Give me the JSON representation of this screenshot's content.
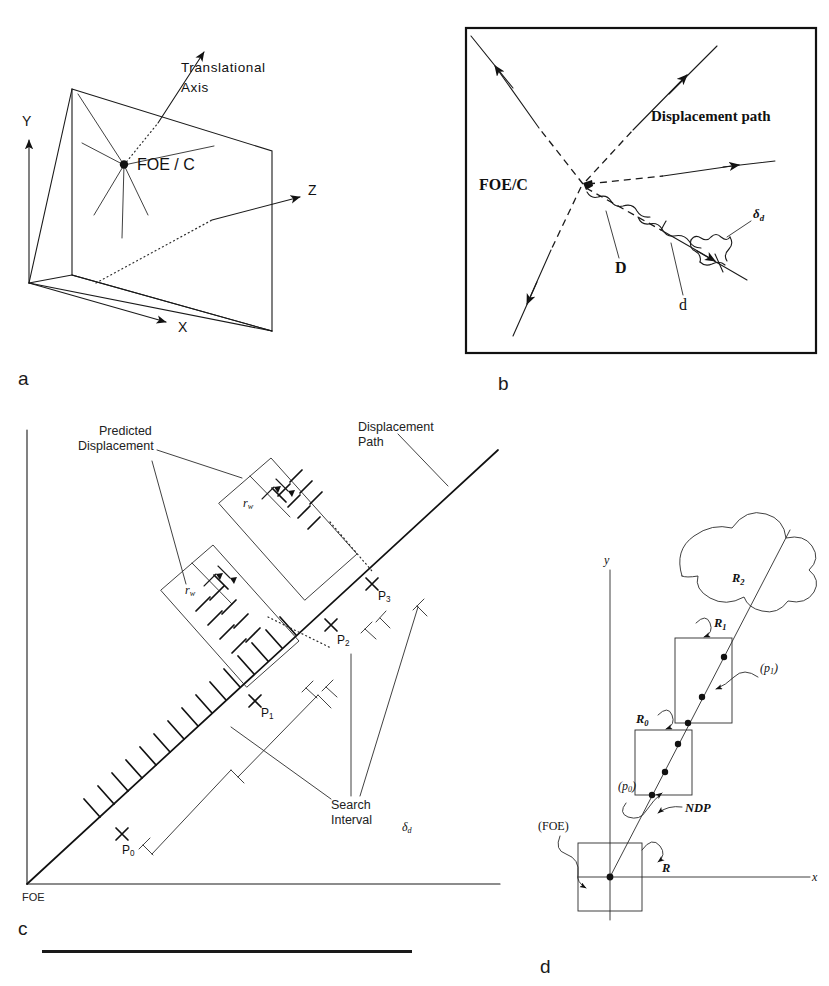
{
  "figure": {
    "width": 829,
    "height": 986,
    "background": "#ffffff",
    "ink": "#1a1a1a"
  },
  "panels": [
    {
      "id": "a",
      "letter": "a",
      "caption": "3D camera coordinate frame with image plane and focus of expansion",
      "labels": {
        "translational_axis_line1": "Translational",
        "translational_axis_line2": "Axis",
        "foe": "FOE / C",
        "axis_y": "Y",
        "axis_x": "X",
        "axis_z": "Z"
      }
    },
    {
      "id": "b",
      "letter": "b",
      "caption": "Image plane with radiating displacement paths from FOE/C",
      "labels": {
        "displacement_path": "Displacement path",
        "foe": "FOE/C",
        "distance_D": "D",
        "distance_d": "d",
        "delta_d": "δ",
        "delta_d_sub": "d"
      }
    },
    {
      "id": "c",
      "letter": "c",
      "caption": "Predicted displacement and search interval along the displacement path",
      "labels": {
        "predicted_displacement_line1": "Predicted",
        "predicted_displacement_line2": "Displacement",
        "displacement_path_line1": "Displacement",
        "displacement_path_line2": "Path",
        "search_interval_line1": "Search",
        "search_interval_line2": "Interval",
        "search_interval_symbol": "δ",
        "search_interval_symbol_sub": "d",
        "foe": "FOE",
        "r_w": "r",
        "r_w_sub": "w",
        "points": [
          {
            "name": "P",
            "sub": "0"
          },
          {
            "name": "P",
            "sub": "1"
          },
          {
            "name": "P",
            "sub": "2"
          },
          {
            "name": "P",
            "sub": "3"
          }
        ]
      }
    },
    {
      "id": "d",
      "letter": "d",
      "caption": "Image coordinates with nearest displacement path and search regions",
      "labels": {
        "axis_y": "y",
        "axis_x": "x",
        "region_R": "R",
        "region_R0": "R",
        "region_R0_sub": "0",
        "region_R1": "R",
        "region_R1_sub": "1",
        "region_R2": "R",
        "region_R2_sub": "2",
        "point_p0": "(p",
        "point_p0_sub": "0",
        "point_p0_close": ")",
        "point_p1": "(p",
        "point_p1_sub": "1",
        "point_p1_close": ")",
        "foe": "(FOE)",
        "ndp": "NDP"
      }
    }
  ]
}
